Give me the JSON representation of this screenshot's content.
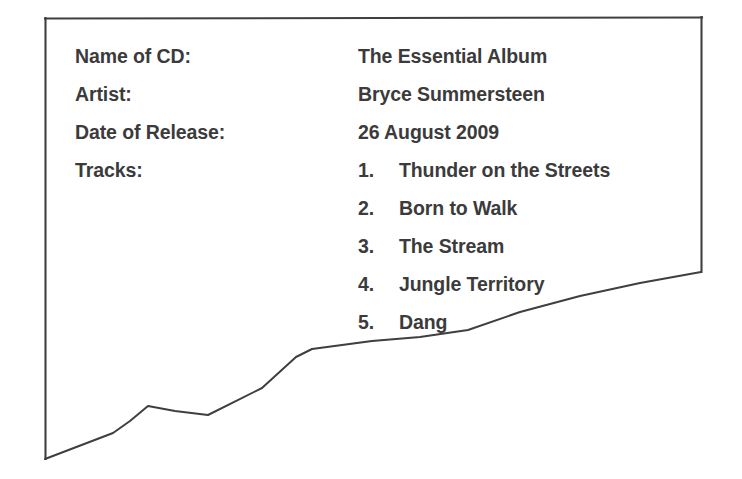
{
  "document": {
    "type": "cd-information-card",
    "fields": [
      {
        "label": "Name of CD:",
        "value": "The Essential Album"
      },
      {
        "label": "Artist:",
        "value": "Bryce Summersteen"
      },
      {
        "label": "Date of Release:",
        "value": "26 August 2009"
      },
      {
        "label": "Tracks:",
        "value": ""
      }
    ],
    "tracks": [
      {
        "number": "1.",
        "title": "Thunder on the Streets"
      },
      {
        "number": "2.",
        "title": "Born to Walk"
      },
      {
        "number": "3.",
        "title": "The Stream"
      },
      {
        "number": "4.",
        "title": "Jungle Territory"
      },
      {
        "number": "5.",
        "title": "Dang"
      }
    ]
  },
  "colors": {
    "text": "#3b3b3b",
    "frame": "#3f3f3f",
    "background": "#ffffff"
  }
}
